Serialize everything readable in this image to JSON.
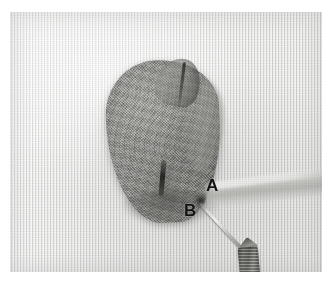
{
  "figure": {
    "caption_text": "",
    "background_color": "#ffffff",
    "plate": {
      "left": 10,
      "top": 12,
      "width": 312,
      "height": 260,
      "description": "Intraoperative grayscale photograph of a tissue specimen resting on woven surgical gauze"
    }
  },
  "scene": {
    "background_name": "surgical-gauze",
    "background_color": "#e9e9e7",
    "specimen_name": "tissue-specimen",
    "specimen_color": "#8e8e8a",
    "band_name": "tissue-band",
    "band_color": "#b4b4b0",
    "needle_name": "suture-needle",
    "needle_color": "#d8d8d4",
    "instrument_name": "instrument-clamp",
    "instrument_color": "#707069"
  },
  "annotations": {
    "labels": [
      {
        "id": "A",
        "text": "A",
        "x": 196,
        "y": 165,
        "color": "#131313"
      },
      {
        "id": "B",
        "text": "B",
        "x": 174,
        "y": 190,
        "color": "#131313"
      }
    ]
  }
}
